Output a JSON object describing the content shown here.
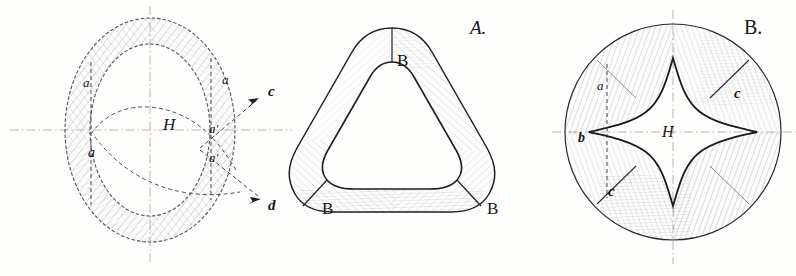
{
  "plate": {
    "kind": "antique-ink-technical-drawing",
    "background_color": "#fefefd",
    "ink_color": "#24222a",
    "hatch_color": "#6f6b74",
    "centerline_color": "#c9a0a6",
    "construction_color": "#4a4750",
    "figure_count": 3
  },
  "figures": [
    {
      "id": "fig-left",
      "name": "annulus-construction-diagram",
      "caption": "",
      "center_label": "H",
      "labels": [
        {
          "text": "a",
          "name": "label-a-upper-left"
        },
        {
          "text": "a",
          "name": "label-a-lower-left"
        },
        {
          "text": "a",
          "name": "label-a-upper-right"
        },
        {
          "text": "a'",
          "name": "label-a-prime-upper-right"
        },
        {
          "text": "a'",
          "name": "label-a-prime-lower-right"
        },
        {
          "text": "c",
          "name": "label-c-arrow"
        },
        {
          "text": "d",
          "name": "label-d-arrow"
        }
      ]
    },
    {
      "id": "fig-middle",
      "name": "rounded-triangle-section",
      "caption": "A.",
      "center_label": "",
      "labels": [
        {
          "text": "B",
          "name": "label-b-top"
        },
        {
          "text": "B",
          "name": "label-b-bottom-left"
        },
        {
          "text": "B",
          "name": "label-b-bottom-right"
        }
      ]
    },
    {
      "id": "fig-right",
      "name": "four-point-star-bore-section",
      "caption": "B.",
      "center_label": "H",
      "labels": [
        {
          "text": "a",
          "name": "label-a-left-upper"
        },
        {
          "text": "b",
          "name": "label-b-left"
        },
        {
          "text": "c",
          "name": "label-c-upper-right"
        },
        {
          "text": "c",
          "name": "label-c-lower-left"
        }
      ]
    }
  ],
  "text": {
    "fig_left_H": "H",
    "fig_left_a1": "a",
    "fig_left_a2": "a",
    "fig_left_a3": "a",
    "fig_left_ap1": "a'",
    "fig_left_ap2": "a'",
    "fig_left_c": "c",
    "fig_left_d": "d",
    "fig_mid_caption": "A.",
    "fig_mid_B1": "B",
    "fig_mid_B2": "B",
    "fig_mid_B3": "B",
    "fig_right_caption": "B.",
    "fig_right_H": "H",
    "fig_right_a": "a",
    "fig_right_b": "b",
    "fig_right_c1": "c",
    "fig_right_c2": "c"
  }
}
